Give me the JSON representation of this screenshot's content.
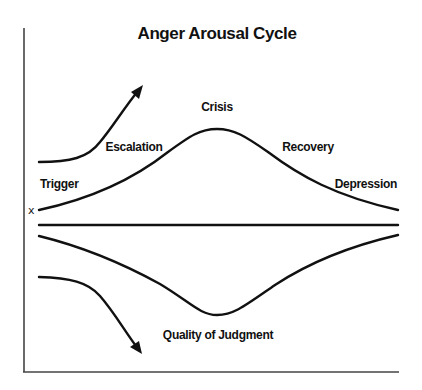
{
  "title": "Anger Arousal Cycle",
  "stages": {
    "trigger": "Trigger",
    "escalation": "Escalation",
    "crisis": "Crisis",
    "recovery": "Recovery",
    "depression": "Depression"
  },
  "lower_label": "Quality of Judgment",
  "baseline_marker": "x",
  "colors": {
    "line": "#111111",
    "axis": "#444444",
    "background": "#ffffff"
  },
  "curves": {
    "arousal": "bell curve rising from Trigger through Escalation, peaking at Crisis, falling through Recovery to Depression",
    "baseline": "horizontal line",
    "judgment": "inverted bell curve mirroring arousal, lowest at Crisis",
    "arrow_up": "rising arrow at top-left",
    "arrow_down": "falling arrow at bottom-left"
  }
}
